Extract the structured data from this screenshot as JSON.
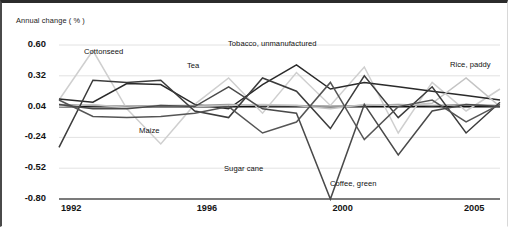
{
  "figure": {
    "axis_title": "Annual change ( % )"
  },
  "chart_data": {
    "type": "line",
    "title": "Annual change ( % )",
    "xlabel": "",
    "ylabel": "Annual change ( % )",
    "grid": true,
    "legend_position": "inline-annotations",
    "x": [
      1992,
      1993,
      1994,
      1995,
      1996,
      1997,
      1998,
      1999,
      2000,
      2001,
      2002,
      2003,
      2004,
      2005
    ],
    "xlim": [
      1992,
      2005
    ],
    "ylim": [
      -0.8,
      0.6
    ],
    "xticks": [
      1992,
      1996,
      2000,
      2005
    ],
    "xticklabels": [
      "1992",
      "1996",
      "2000",
      "2005"
    ],
    "yticks": [
      0.6,
      0.32,
      0.04,
      -0.24,
      -0.52,
      -0.8
    ],
    "yticklabels": [
      "0.60",
      "0.32",
      "0.04",
      "-0.24",
      "-0.52",
      "-0.80"
    ],
    "zero_line": 0.04,
    "series": [
      {
        "name": "Cottonseed",
        "color": "#cfcfcf",
        "values": [
          0.1,
          0.55,
          0.02,
          -0.3,
          0.06,
          0.3,
          -0.02,
          0.35,
          0.05,
          0.4,
          -0.2,
          0.26,
          0.0,
          0.2
        ]
      },
      {
        "name": "Tea",
        "color": "#2a2a2a",
        "values": [
          0.11,
          0.08,
          0.25,
          0.24,
          0.06,
          0.02,
          0.24,
          0.42,
          0.2,
          0.26,
          0.22,
          0.18,
          0.14,
          0.1
        ]
      },
      {
        "name": "Tobacco, unmanufactured",
        "color": "#9a9a9a",
        "values": [
          0.06,
          0.05,
          0.04,
          0.05,
          0.05,
          0.06,
          0.05,
          0.05,
          0.04,
          0.05,
          0.06,
          0.05,
          0.06,
          0.05
        ]
      },
      {
        "name": "Rice, paddy",
        "color": "#c4c4c4",
        "values": [
          0.04,
          0.06,
          0.03,
          0.05,
          0.04,
          0.05,
          0.06,
          0.05,
          0.02,
          0.06,
          0.05,
          0.07,
          0.3,
          0.04
        ]
      },
      {
        "name": "Maize",
        "color": "#3c3c3c",
        "values": [
          -0.33,
          0.28,
          0.26,
          0.28,
          0.0,
          -0.06,
          0.3,
          0.18,
          -0.16,
          0.32,
          -0.06,
          0.22,
          -0.2,
          0.08
        ]
      },
      {
        "name": "Sugar cane",
        "color": "#555555",
        "values": [
          0.1,
          -0.05,
          -0.06,
          -0.05,
          -0.02,
          0.04,
          -0.2,
          -0.1,
          0.26,
          -0.26,
          0.04,
          0.1,
          -0.1,
          0.06
        ]
      },
      {
        "name": "Coffee, green",
        "color": "#4a4a4a",
        "values": [
          0.06,
          0.02,
          0.02,
          0.05,
          0.04,
          0.22,
          0.02,
          -0.02,
          -0.8,
          0.06,
          -0.4,
          0.0,
          0.06,
          0.04
        ]
      }
    ],
    "annotations": [
      {
        "text": "Cottonseed",
        "x_px": 82,
        "y_px": 44
      },
      {
        "text": "Tobacco, unmanufactured",
        "x_px": 226,
        "y_px": 36
      },
      {
        "text": "Tea",
        "x_px": 185,
        "y_px": 58
      },
      {
        "text": "Rice, paddy",
        "x_px": 448,
        "y_px": 57
      },
      {
        "text": "Maize",
        "x_px": 137,
        "y_px": 123
      },
      {
        "text": "Sugar cane",
        "x_px": 222,
        "y_px": 161
      },
      {
        "text": "Coffee, green",
        "x_px": 328,
        "y_px": 176
      }
    ]
  }
}
